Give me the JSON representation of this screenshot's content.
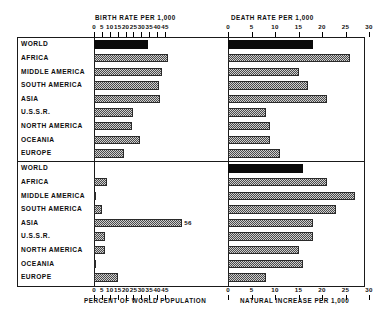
{
  "figure": {
    "regions": [
      "WORLD",
      "AFRICA",
      "MIDDLE AMERICA",
      "SOUTH AMERICA",
      "ASIA",
      "U.S.S.R.",
      "NORTH AMERICA",
      "OCEANIA",
      "EUROPE"
    ]
  },
  "panels": {
    "birth": {
      "title": "BIRTH RATE PER 1,000",
      "ticks": [
        0,
        5,
        10,
        15,
        20,
        25,
        30,
        35,
        40,
        45
      ],
      "axis_min": 0,
      "axis_max": 45
    },
    "death": {
      "title": "DEATH RATE PER 1,000",
      "ticks": [
        0,
        5,
        10,
        15,
        20,
        25,
        30
      ],
      "axis_min": 0,
      "axis_max": 30
    },
    "percent": {
      "caption": "PERCENT OF WORLD POPULATION",
      "ticks": [
        0,
        5,
        10,
        15,
        20,
        25,
        30,
        35,
        40,
        45
      ],
      "axis_min": 0,
      "axis_max": 45
    },
    "natural_increase": {
      "caption": "NATURAL INCREASE PER 1,000",
      "ticks": [
        0,
        5,
        10,
        15,
        20,
        25,
        30
      ],
      "axis_min": 0,
      "axis_max": 30
    }
  },
  "chart_data": {
    "type": "bar",
    "orientation": "horizontal",
    "grid": false,
    "legend": null,
    "categories": [
      "WORLD",
      "AFRICA",
      "MIDDLE AMERICA",
      "SOUTH AMERICA",
      "ASIA",
      "U.S.S.R.",
      "NORTH AMERICA",
      "OCEANIA",
      "EUROPE"
    ],
    "panels": [
      {
        "key": "birth",
        "position": "top-left",
        "title": "BIRTH RATE PER 1,000",
        "xlabel": "",
        "ylabel": "",
        "xlim": [
          0,
          45
        ],
        "xticks": [
          0,
          5,
          10,
          15,
          20,
          25,
          30,
          35,
          40,
          45
        ],
        "values": [
          34,
          47,
          43,
          41,
          42,
          25,
          24,
          29,
          19
        ],
        "highlight_index": 0
      },
      {
        "key": "death",
        "position": "top-right",
        "title": "DEATH RATE PER 1,000",
        "xlabel": "",
        "ylabel": "",
        "xlim": [
          0,
          30
        ],
        "xticks": [
          0,
          5,
          10,
          15,
          20,
          25,
          30
        ],
        "values": [
          18,
          26,
          15,
          17,
          21,
          8,
          9,
          9,
          11
        ],
        "highlight_index": 0
      },
      {
        "key": "percent",
        "position": "bottom-left",
        "title": "",
        "xlabel": "PERCENT OF WORLD POPULATION",
        "ylabel": "",
        "xlim": [
          0,
          45
        ],
        "xticks": [
          0,
          5,
          10,
          15,
          20,
          25,
          30,
          35,
          40,
          45
        ],
        "values": [
          0,
          8,
          1,
          5,
          56,
          7,
          7,
          0.5,
          15
        ],
        "labels": [
          "",
          "",
          "",
          "",
          "56",
          "",
          "",
          "",
          ""
        ],
        "highlight_index": 0
      },
      {
        "key": "natural_increase",
        "position": "bottom-right",
        "title": "",
        "xlabel": "NATURAL INCREASE PER 1,000",
        "ylabel": "",
        "xlim": [
          0,
          30
        ],
        "xticks": [
          0,
          5,
          10,
          15,
          20,
          25,
          30
        ],
        "values": [
          16,
          21,
          27,
          23,
          18,
          18,
          15,
          16,
          8
        ],
        "highlight_index": 0
      }
    ]
  }
}
